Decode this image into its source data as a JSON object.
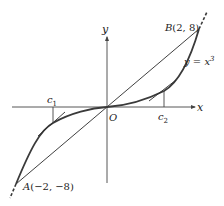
{
  "figure": {
    "curve_label": "y = x",
    "curve_exponent": "3",
    "axes": {
      "x_label": "x",
      "y_label": "y",
      "origin_label": "O"
    },
    "points": {
      "B": {
        "name": "B",
        "coords": "(2, 8)"
      },
      "A": {
        "name": "A",
        "coords": "(−2, −8)"
      }
    },
    "markers": {
      "c1": {
        "base": "c",
        "sub": "1"
      },
      "c2": {
        "base": "c",
        "sub": "2"
      }
    },
    "colors": {
      "curve": "#3a3a3a",
      "line": "#2a2a2a",
      "axis": "#444444"
    }
  }
}
